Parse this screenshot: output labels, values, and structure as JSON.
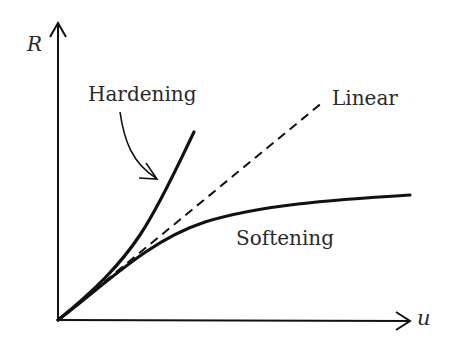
{
  "diagram": {
    "type": "load-displacement curves",
    "axes": {
      "y_label": "R",
      "x_label": "u"
    },
    "curves": [
      {
        "name": "Hardening",
        "label": "Hardening",
        "style": "solid"
      },
      {
        "name": "Linear",
        "label": "Linear",
        "style": "dashed"
      },
      {
        "name": "Softening",
        "label": "Softening",
        "style": "solid"
      }
    ],
    "colors": {
      "line": "#111111",
      "text": "#2a2a2a",
      "background": "#ffffff"
    }
  }
}
